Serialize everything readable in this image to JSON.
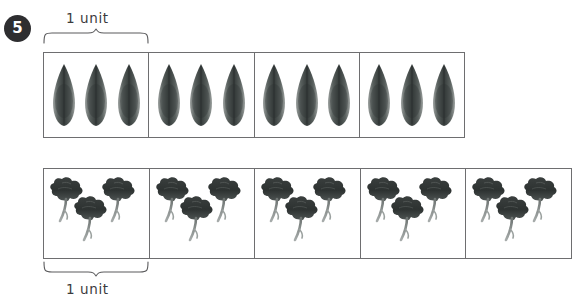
{
  "question": {
    "number": "5"
  },
  "labels": {
    "unit_top": "1 unit",
    "unit_bottom": "1 unit"
  },
  "colors": {
    "badge_background": "#2e2e30",
    "badge_text": "#ffffff",
    "grid_border": "#6e6e70",
    "brace_stroke": "#5a5a5c",
    "label_text": "#3b3b3d",
    "leaf_dark": "#3c4140",
    "leaf_mid": "#5d6462",
    "leaf_light": "#8b918f",
    "flower_dark": "#2f3333",
    "flower_mid": "#4d5251",
    "stem_gray": "#7d8381",
    "page_background": "#ffffff"
  },
  "bar_models": [
    {
      "name": "leaves-bar",
      "item": "leaf",
      "icon": "leaf-icon",
      "cells": 4,
      "items_per_cell": 3,
      "total_items": 12,
      "unit_bracket": {
        "label": "1 unit",
        "position": "top",
        "spans_cells": 1
      }
    },
    {
      "name": "flowers-bar",
      "item": "flower",
      "icon": "flower-icon",
      "cells": 5,
      "items_per_cell": 3,
      "total_items": 15,
      "unit_bracket": {
        "label": "1 unit",
        "position": "bottom",
        "spans_cells": 1
      }
    }
  ]
}
